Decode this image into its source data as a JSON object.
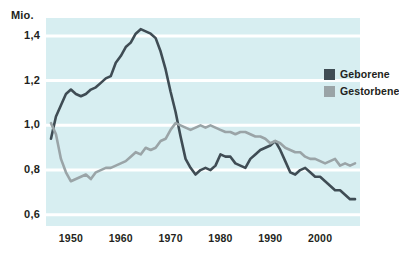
{
  "chart_data": {
    "type": "line",
    "title": "",
    "subtitle": "",
    "xlabel": "",
    "ylabel": "Mio.",
    "unit_label": "Mio.",
    "xlim": [
      1945,
      2008
    ],
    "ylim": [
      0.55,
      1.48
    ],
    "grid": true,
    "grid_orientation": "horizontal",
    "legend_position": "top-right",
    "background_color": "#d7eef1",
    "gridline_color": "#ffffff",
    "y_ticks": [
      0.6,
      0.8,
      1.0,
      1.2,
      1.4
    ],
    "y_tick_labels": [
      "0,6",
      "0,8",
      "1,0",
      "1,2",
      "1,4"
    ],
    "x_ticks": [
      1950,
      1960,
      1970,
      1980,
      1990,
      2000
    ],
    "x_tick_labels": [
      "1950",
      "1960",
      "1970",
      "1980",
      "1990",
      "2000"
    ],
    "series": [
      {
        "name": "Geborene",
        "color": "#3f4c54",
        "x": [
          1946,
          1947,
          1948,
          1949,
          1950,
          1951,
          1952,
          1953,
          1954,
          1955,
          1956,
          1957,
          1958,
          1959,
          1960,
          1961,
          1962,
          1963,
          1964,
          1965,
          1966,
          1967,
          1968,
          1969,
          1970,
          1971,
          1972,
          1973,
          1974,
          1975,
          1976,
          1977,
          1978,
          1979,
          1980,
          1981,
          1982,
          1983,
          1984,
          1985,
          1986,
          1987,
          1988,
          1989,
          1990,
          1991,
          1992,
          1993,
          1994,
          1995,
          1996,
          1997,
          1998,
          1999,
          2000,
          2001,
          2002,
          2003,
          2004,
          2005,
          2006,
          2007
        ],
        "values": [
          0.94,
          1.04,
          1.09,
          1.14,
          1.16,
          1.14,
          1.13,
          1.14,
          1.16,
          1.17,
          1.19,
          1.21,
          1.22,
          1.28,
          1.31,
          1.35,
          1.37,
          1.41,
          1.43,
          1.42,
          1.41,
          1.39,
          1.33,
          1.25,
          1.15,
          1.06,
          0.95,
          0.85,
          0.81,
          0.78,
          0.8,
          0.81,
          0.8,
          0.82,
          0.87,
          0.86,
          0.86,
          0.83,
          0.82,
          0.81,
          0.85,
          0.87,
          0.89,
          0.9,
          0.91,
          0.93,
          0.89,
          0.84,
          0.79,
          0.78,
          0.8,
          0.81,
          0.79,
          0.77,
          0.77,
          0.75,
          0.73,
          0.71,
          0.71,
          0.69,
          0.67,
          0.67
        ]
      },
      {
        "name": "Gestorbene",
        "color": "#9aa4a7",
        "x": [
          1946,
          1947,
          1948,
          1949,
          1950,
          1951,
          1952,
          1953,
          1954,
          1955,
          1956,
          1957,
          1958,
          1959,
          1960,
          1961,
          1962,
          1963,
          1964,
          1965,
          1966,
          1967,
          1968,
          1969,
          1970,
          1971,
          1972,
          1973,
          1974,
          1975,
          1976,
          1977,
          1978,
          1979,
          1980,
          1981,
          1982,
          1983,
          1984,
          1985,
          1986,
          1987,
          1988,
          1989,
          1990,
          1991,
          1992,
          1993,
          1994,
          1995,
          1996,
          1997,
          1998,
          1999,
          2000,
          2001,
          2002,
          2003,
          2004,
          2005,
          2006,
          2007
        ],
        "values": [
          1.01,
          0.96,
          0.85,
          0.79,
          0.75,
          0.76,
          0.77,
          0.78,
          0.76,
          0.79,
          0.8,
          0.81,
          0.81,
          0.82,
          0.83,
          0.84,
          0.86,
          0.88,
          0.87,
          0.9,
          0.89,
          0.9,
          0.93,
          0.94,
          0.98,
          1.01,
          1.0,
          0.99,
          0.98,
          0.99,
          1.0,
          0.99,
          1.0,
          0.99,
          0.98,
          0.97,
          0.97,
          0.96,
          0.97,
          0.97,
          0.96,
          0.95,
          0.95,
          0.94,
          0.92,
          0.93,
          0.92,
          0.9,
          0.89,
          0.88,
          0.88,
          0.86,
          0.85,
          0.85,
          0.84,
          0.83,
          0.84,
          0.85,
          0.82,
          0.83,
          0.82,
          0.83
        ]
      }
    ],
    "legend": [
      {
        "label": "Geborene",
        "color": "#3f4c54"
      },
      {
        "label": "Gestorbene",
        "color": "#9aa4a7"
      }
    ]
  }
}
